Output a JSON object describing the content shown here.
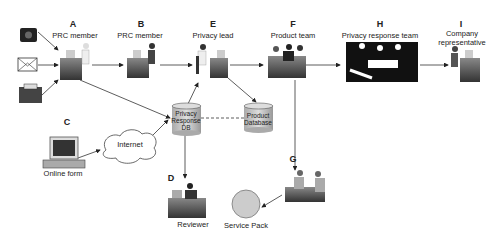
{
  "diagram": {
    "nodes": {
      "A": {
        "letter": "A",
        "label": "PRC member"
      },
      "B": {
        "letter": "B",
        "label": "PRC member"
      },
      "C": {
        "letter": "C",
        "label": "Online form"
      },
      "D": {
        "letter": "D",
        "label": "Reviewer"
      },
      "E": {
        "letter": "E",
        "label": "Privacy lead"
      },
      "F": {
        "letter": "F",
        "label": "Product team"
      },
      "G": {
        "letter": "G",
        "label": ""
      },
      "H": {
        "letter": "H",
        "label": "Privacy response team"
      },
      "I": {
        "letter": "I",
        "label_line1": "Company",
        "label_line2": "representative"
      }
    },
    "inputs": [
      "telephone",
      "mail",
      "fax"
    ],
    "internet": {
      "label": "Internet"
    },
    "databases": {
      "privacy_db": {
        "line1": "Privacy",
        "line2": "Response",
        "line3": "DB"
      },
      "product_db": {
        "line1": "Product",
        "line2": "Database"
      }
    },
    "service_pack": {
      "label": "Service Pack"
    },
    "colors": {
      "line": "#333333",
      "db_fill": "#c8c8c8",
      "desk": "#555555",
      "circle": "#cccccc"
    }
  }
}
